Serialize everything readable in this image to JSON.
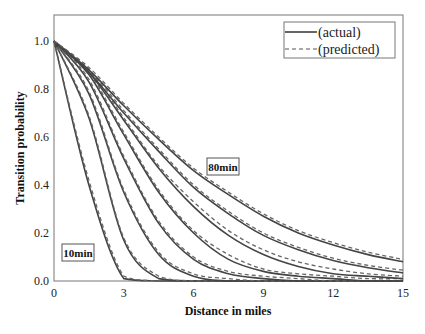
{
  "chart_data": {
    "type": "line",
    "title": "",
    "xlabel": "Distance in miles",
    "ylabel": "Transition probability",
    "xlim": [
      0,
      15
    ],
    "ylim": [
      0,
      1.1
    ],
    "xticks": [
      "0",
      "3",
      "6",
      "9",
      "12",
      "15"
    ],
    "yticks": [
      "0.0",
      "0.2",
      "0.4",
      "0.6",
      "0.8",
      "1.0"
    ],
    "grid": false,
    "legend": {
      "position": "upper right",
      "entries": [
        {
          "label": "(actual)",
          "style": "solid"
        },
        {
          "label": "(predicted)",
          "style": "dashed"
        }
      ]
    },
    "annotations": [
      {
        "text": "10min",
        "x": 1.3,
        "y": 0.11
      },
      {
        "text": "80min",
        "x": 7.3,
        "y": 0.47
      }
    ],
    "x": [
      0,
      1.5,
      3,
      4.5,
      6,
      7.5,
      9,
      10.5,
      12,
      13.5,
      15
    ],
    "series": [
      {
        "name": "10min (actual)",
        "style": "solid",
        "values": [
          1.0,
          0.4,
          0.01,
          0.0,
          0.0,
          0.0,
          0.0,
          0.0,
          0.0,
          0.0,
          0.0
        ]
      },
      {
        "name": "10min (predicted)",
        "style": "dashed",
        "values": [
          1.0,
          0.42,
          0.02,
          0.0,
          0.0,
          0.0,
          0.0,
          0.0,
          0.0,
          0.0,
          0.0
        ]
      },
      {
        "name": "20min (actual)",
        "style": "solid",
        "values": [
          1.0,
          0.68,
          0.17,
          0.01,
          0.0,
          0.0,
          0.0,
          0.0,
          0.0,
          0.0,
          0.0
        ]
      },
      {
        "name": "20min (predicted)",
        "style": "dashed",
        "values": [
          1.0,
          0.69,
          0.18,
          0.02,
          0.0,
          0.0,
          0.0,
          0.0,
          0.0,
          0.0,
          0.0
        ]
      },
      {
        "name": "30min (actual)",
        "style": "solid",
        "values": [
          1.0,
          0.78,
          0.37,
          0.11,
          0.02,
          0.0,
          0.0,
          0.0,
          0.0,
          0.0,
          0.0
        ]
      },
      {
        "name": "30min (predicted)",
        "style": "dashed",
        "values": [
          1.0,
          0.79,
          0.38,
          0.12,
          0.03,
          0.01,
          0.0,
          0.0,
          0.0,
          0.0,
          0.0
        ]
      },
      {
        "name": "40min (actual)",
        "style": "solid",
        "values": [
          1.0,
          0.83,
          0.51,
          0.24,
          0.09,
          0.03,
          0.01,
          0.0,
          0.0,
          0.0,
          0.0
        ]
      },
      {
        "name": "40min (predicted)",
        "style": "dashed",
        "values": [
          1.0,
          0.84,
          0.52,
          0.25,
          0.1,
          0.04,
          0.02,
          0.01,
          0.0,
          0.0,
          0.0
        ]
      },
      {
        "name": "50min (actual)",
        "style": "solid",
        "values": [
          1.0,
          0.86,
          0.61,
          0.37,
          0.2,
          0.09,
          0.04,
          0.02,
          0.01,
          0.0,
          0.0
        ]
      },
      {
        "name": "50min (predicted)",
        "style": "dashed",
        "values": [
          1.0,
          0.87,
          0.62,
          0.38,
          0.21,
          0.11,
          0.05,
          0.03,
          0.02,
          0.01,
          0.01
        ]
      },
      {
        "name": "60min (actual)",
        "style": "solid",
        "values": [
          1.0,
          0.87,
          0.67,
          0.47,
          0.31,
          0.19,
          0.11,
          0.06,
          0.03,
          0.02,
          0.01
        ]
      },
      {
        "name": "60min (predicted)",
        "style": "dashed",
        "values": [
          1.0,
          0.88,
          0.68,
          0.48,
          0.33,
          0.21,
          0.13,
          0.08,
          0.05,
          0.03,
          0.02
        ]
      },
      {
        "name": "70min (actual)",
        "style": "solid",
        "values": [
          1.0,
          0.87,
          0.7,
          0.54,
          0.39,
          0.28,
          0.19,
          0.13,
          0.085,
          0.055,
          0.034
        ]
      },
      {
        "name": "70min (predicted)",
        "style": "dashed",
        "values": [
          1.0,
          0.88,
          0.71,
          0.55,
          0.4,
          0.29,
          0.2,
          0.14,
          0.095,
          0.065,
          0.045
        ]
      },
      {
        "name": "80min (actual)",
        "style": "solid",
        "values": [
          1.0,
          0.88,
          0.73,
          0.59,
          0.46,
          0.36,
          0.27,
          0.2,
          0.15,
          0.11,
          0.08
        ]
      },
      {
        "name": "80min (predicted)",
        "style": "dashed",
        "values": [
          1.0,
          0.89,
          0.74,
          0.6,
          0.47,
          0.37,
          0.28,
          0.21,
          0.16,
          0.12,
          0.09
        ]
      }
    ]
  }
}
